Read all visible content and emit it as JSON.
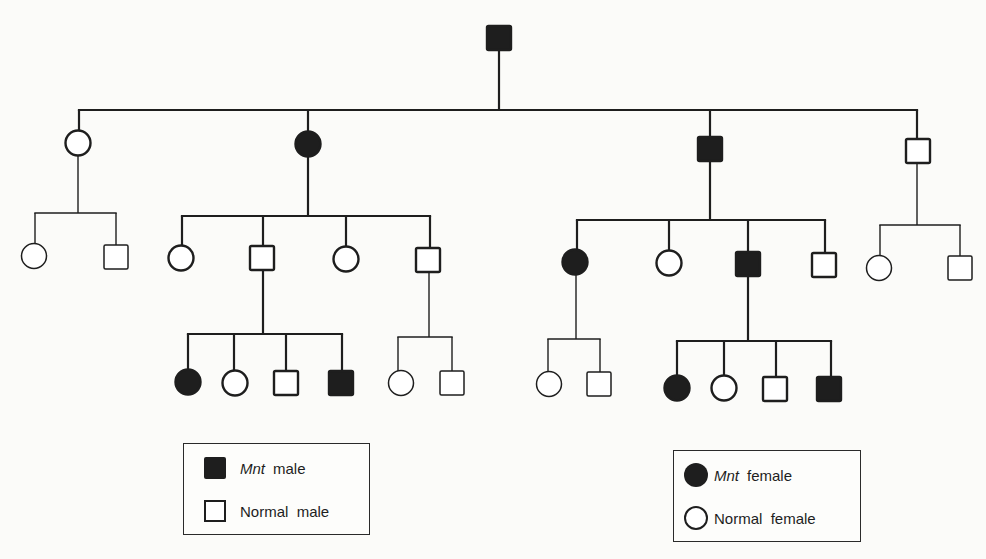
{
  "diagram": {
    "type": "pedigree",
    "trait": "Mnt",
    "colors": {
      "line": "#1e1e1e",
      "background": "#fbfbf9",
      "affected_fill": "#1e1e1e",
      "normal_fill": "#ffffff"
    },
    "generations": [
      {
        "id": "I",
        "individuals": [
          {
            "id": "I-1",
            "sex": "male",
            "affected": true,
            "x": 499,
            "y": 38
          }
        ]
      },
      {
        "id": "II",
        "individuals": [
          {
            "id": "II-1",
            "sex": "female",
            "affected": false,
            "x": 78,
            "y": 143
          },
          {
            "id": "II-2",
            "sex": "female",
            "affected": true,
            "x": 308,
            "y": 144
          },
          {
            "id": "II-3",
            "sex": "male",
            "affected": true,
            "x": 710,
            "y": 149
          },
          {
            "id": "II-4",
            "sex": "male",
            "affected": false,
            "x": 918,
            "y": 151
          }
        ]
      },
      {
        "id": "III",
        "individuals": [
          {
            "id": "III-1",
            "sex": "female",
            "affected": false,
            "x": 34,
            "y": 256,
            "parent": "II-1"
          },
          {
            "id": "III-2",
            "sex": "male",
            "affected": false,
            "x": 116,
            "y": 257,
            "parent": "II-1"
          },
          {
            "id": "III-3",
            "sex": "female",
            "affected": false,
            "x": 181,
            "y": 258,
            "parent": "II-2"
          },
          {
            "id": "III-4",
            "sex": "male",
            "affected": false,
            "x": 262,
            "y": 258,
            "parent": "II-2"
          },
          {
            "id": "III-5",
            "sex": "female",
            "affected": false,
            "x": 346,
            "y": 259,
            "parent": "II-2"
          },
          {
            "id": "III-6",
            "sex": "male",
            "affected": false,
            "x": 428,
            "y": 260,
            "parent": "II-2"
          },
          {
            "id": "III-7",
            "sex": "female",
            "affected": true,
            "x": 575,
            "y": 262,
            "parent": "II-3"
          },
          {
            "id": "III-8",
            "sex": "female",
            "affected": false,
            "x": 669,
            "y": 263,
            "parent": "II-3"
          },
          {
            "id": "III-9",
            "sex": "male",
            "affected": true,
            "x": 748,
            "y": 264,
            "parent": "II-3"
          },
          {
            "id": "III-10",
            "sex": "male",
            "affected": false,
            "x": 824,
            "y": 265,
            "parent": "II-3"
          },
          {
            "id": "III-11",
            "sex": "female",
            "affected": false,
            "x": 879,
            "y": 268,
            "parent": "II-4"
          },
          {
            "id": "III-12",
            "sex": "male",
            "affected": false,
            "x": 960,
            "y": 268,
            "parent": "II-4"
          }
        ]
      },
      {
        "id": "IV",
        "individuals": [
          {
            "id": "IV-1",
            "sex": "female",
            "affected": true,
            "x": 188,
            "y": 382,
            "parent": "III-4"
          },
          {
            "id": "IV-2",
            "sex": "female",
            "affected": false,
            "x": 235,
            "y": 383,
            "parent": "III-4"
          },
          {
            "id": "IV-3",
            "sex": "male",
            "affected": false,
            "x": 286,
            "y": 383,
            "parent": "III-4"
          },
          {
            "id": "IV-4",
            "sex": "male",
            "affected": true,
            "x": 341,
            "y": 383,
            "parent": "III-4"
          },
          {
            "id": "IV-5",
            "sex": "female",
            "affected": false,
            "x": 401,
            "y": 383,
            "parent": "III-6"
          },
          {
            "id": "IV-6",
            "sex": "male",
            "affected": false,
            "x": 452,
            "y": 383,
            "parent": "III-6"
          },
          {
            "id": "IV-7",
            "sex": "female",
            "affected": false,
            "x": 549,
            "y": 384,
            "parent": "III-7"
          },
          {
            "id": "IV-8",
            "sex": "male",
            "affected": false,
            "x": 599,
            "y": 384,
            "parent": "III-7"
          },
          {
            "id": "IV-9",
            "sex": "female",
            "affected": true,
            "x": 677,
            "y": 388,
            "parent": "III-9"
          },
          {
            "id": "IV-10",
            "sex": "female",
            "affected": false,
            "x": 724,
            "y": 388,
            "parent": "III-9"
          },
          {
            "id": "IV-11",
            "sex": "male",
            "affected": false,
            "x": 775,
            "y": 389,
            "parent": "III-9"
          },
          {
            "id": "IV-12",
            "sex": "male",
            "affected": true,
            "x": 829,
            "y": 389,
            "parent": "III-9"
          }
        ]
      }
    ],
    "sibships": [
      {
        "parent": "I-1",
        "drop_from": [
          499,
          50
        ],
        "bar_y": 110,
        "bar_x": [
          79,
          917
        ],
        "children_x": [
          79,
          308,
          710,
          917
        ],
        "child_top": [
          132,
          133,
          138,
          140
        ],
        "weight": 2.2
      },
      {
        "parent": "II-1",
        "drop_from": [
          78,
          155
        ],
        "bar_y": 213,
        "bar_x": [
          35,
          116
        ],
        "children_x": [
          35,
          116
        ],
        "child_top": [
          245,
          246
        ],
        "weight": 1.4
      },
      {
        "parent": "II-2",
        "drop_from": [
          308,
          156
        ],
        "bar_y": 216,
        "bar_x": [
          182,
          430
        ],
        "children_x": [
          182,
          263,
          346,
          430
        ],
        "child_top": [
          246,
          247,
          247,
          249
        ],
        "weight": 2.2
      },
      {
        "parent": "II-3",
        "drop_from": [
          710,
          161
        ],
        "bar_y": 220,
        "bar_x": [
          577,
          825
        ],
        "children_x": [
          577,
          669,
          748,
          825
        ],
        "child_top": [
          251,
          252,
          253,
          254
        ],
        "weight": 2.2
      },
      {
        "parent": "II-4",
        "drop_from": [
          917,
          163
        ],
        "bar_y": 225,
        "bar_x": [
          880,
          960
        ],
        "children_x": [
          880,
          960
        ],
        "child_top": [
          257,
          257
        ],
        "weight": 1.4
      },
      {
        "parent": "III-4",
        "drop_from": [
          263,
          270
        ],
        "bar_y": 334,
        "bar_x": [
          188,
          342
        ],
        "children_x": [
          188,
          234,
          286,
          342
        ],
        "child_top": [
          371,
          371,
          372,
          372
        ],
        "weight": 2.2
      },
      {
        "parent": "III-6",
        "drop_from": [
          429,
          272
        ],
        "bar_y": 337,
        "bar_x": [
          398,
          452
        ],
        "children_x": [
          398,
          452
        ],
        "child_top": [
          372,
          372
        ],
        "weight": 1.4
      },
      {
        "parent": "III-7",
        "drop_from": [
          576,
          274
        ],
        "bar_y": 339,
        "bar_x": [
          548,
          600
        ],
        "children_x": [
          548,
          600
        ],
        "child_top": [
          373,
          373
        ],
        "weight": 1.4
      },
      {
        "parent": "III-9",
        "drop_from": [
          748,
          276
        ],
        "bar_y": 341,
        "bar_x": [
          677,
          831
        ],
        "children_x": [
          677,
          724,
          776,
          831
        ],
        "child_top": [
          377,
          377,
          377,
          378
        ],
        "weight": 2.2
      }
    ]
  },
  "legends": [
    {
      "id": "male-legend",
      "box": {
        "left": 183,
        "top": 443,
        "width": 187,
        "height": 92
      },
      "items": [
        {
          "symbol": "male-affected",
          "italic": "Mnt",
          "label": "male"
        },
        {
          "symbol": "male-normal",
          "italic": "",
          "label": "Normal  male"
        }
      ]
    },
    {
      "id": "female-legend",
      "box": {
        "left": 673,
        "top": 450,
        "width": 188,
        "height": 92
      },
      "items": [
        {
          "symbol": "female-affected",
          "italic": "Mnt",
          "label": "female"
        },
        {
          "symbol": "female-normal",
          "italic": "",
          "label": "Normal  female"
        }
      ]
    }
  ]
}
